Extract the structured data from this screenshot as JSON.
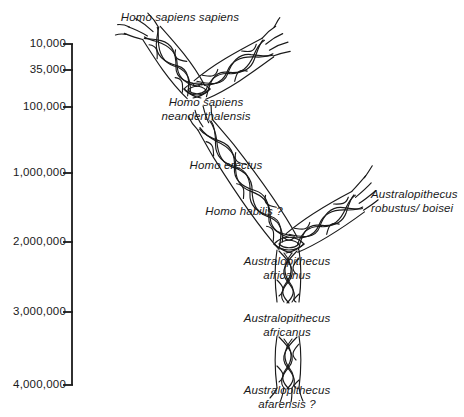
{
  "figure": {
    "kind": "hominid-phylogenetic-tree",
    "background_color": "#ffffff",
    "ink_color": "#1a1a1a"
  },
  "axis": {
    "name": "years-before-present-axis",
    "orientation": "vertical",
    "line_color": "#1a1a1a",
    "top_y": 44,
    "bottom_y": 385,
    "x": 72,
    "ticks": [
      {
        "label": "10,000",
        "y": 44
      },
      {
        "label": "35,000",
        "y": 70
      },
      {
        "label": "100,000",
        "y": 107
      },
      {
        "label": "1,000,000",
        "y": 173
      },
      {
        "label": "2,000,000",
        "y": 242
      },
      {
        "label": "3,000,000",
        "y": 312
      },
      {
        "label": "4,000,000",
        "y": 385
      }
    ]
  },
  "taxa": [
    {
      "id": "homo-sapiens-sapiens",
      "lines": [
        "Homo sapiens sapiens"
      ],
      "x": 180,
      "y": 11,
      "align": "centered"
    },
    {
      "id": "homo-sapiens-neanderthalensis",
      "lines": [
        "Homo sapiens",
        "neanderthalensis"
      ],
      "x": 206,
      "y": 96,
      "align": "centered"
    },
    {
      "id": "homo-erectus",
      "lines": [
        "Homo erectus"
      ],
      "x": 226,
      "y": 159,
      "align": "centered"
    },
    {
      "id": "homo-habilis",
      "lines": [
        "Homo habilis  ?"
      ],
      "x": 244,
      "y": 205,
      "align": "centered"
    },
    {
      "id": "australopithecus-robustus-boisei",
      "lines": [
        "Australopithecus",
        "robustus/ boisei"
      ],
      "x": 371,
      "y": 188,
      "align": "left"
    },
    {
      "id": "australopithecus-africanus-upper",
      "lines": [
        "Australopithecus",
        "africanus"
      ],
      "x": 287,
      "y": 255,
      "align": "centered"
    },
    {
      "id": "australopithecus-africanus-lower",
      "lines": [
        "Australopithecus",
        "africanus"
      ],
      "x": 287,
      "y": 312,
      "align": "centered"
    },
    {
      "id": "australopithecus-afarensis",
      "lines": [
        "Australopithecus",
        "afarensis ?"
      ],
      "x": 287,
      "y": 384,
      "align": "centered"
    }
  ],
  "branches": [
    {
      "id": "branch-sapiens-sapiens",
      "from": [
        196,
        92
      ],
      "to": [
        150,
        30
      ]
    },
    {
      "id": "branch-neanderthalensis",
      "from": [
        200,
        90
      ],
      "to": [
        278,
        42
      ]
    },
    {
      "id": "branch-erectus",
      "from": [
        288,
        243
      ],
      "to": [
        205,
        122
      ]
    },
    {
      "id": "branch-robustus-boisei",
      "from": [
        292,
        243
      ],
      "to": [
        372,
        192
      ]
    },
    {
      "id": "trunk-africanus-upper",
      "from": [
        288,
        248
      ],
      "to": [
        288,
        300
      ]
    },
    {
      "id": "trunk-africanus-lower",
      "from": [
        288,
        330
      ],
      "to": [
        288,
        378
      ]
    }
  ]
}
